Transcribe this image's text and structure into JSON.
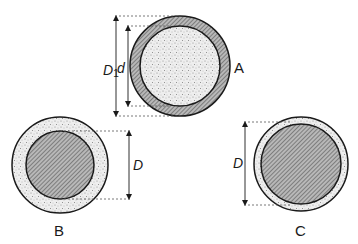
{
  "diagram": {
    "colors": {
      "outline": "#1a1a1a",
      "stipple_fill": "#e6e6e6",
      "hatch_fill": "#9a9a9a",
      "dash": "#555555"
    },
    "figures": [
      {
        "id": "A",
        "label": "A",
        "description": "Stippled core with thin hatched outer shell",
        "core_fill": "stipple",
        "shell_fill": "hatch",
        "dimensions": [
          {
            "symbol": "D",
            "subscript": "1",
            "meaning": "outer diameter"
          },
          {
            "symbol": "d",
            "subscript": "",
            "meaning": "inner diameter"
          }
        ]
      },
      {
        "id": "B",
        "label": "B",
        "description": "Hatched core with thick stippled outer shell",
        "core_fill": "hatch",
        "shell_fill": "stipple",
        "dimensions": [
          {
            "symbol": "D",
            "subscript": "",
            "meaning": "core diameter"
          }
        ]
      },
      {
        "id": "C",
        "label": "C",
        "description": "Hatched core with thin stippled outer shell",
        "core_fill": "hatch",
        "shell_fill": "stipple",
        "dimensions": [
          {
            "symbol": "D",
            "subscript": "",
            "meaning": "overall diameter"
          }
        ]
      }
    ]
  }
}
